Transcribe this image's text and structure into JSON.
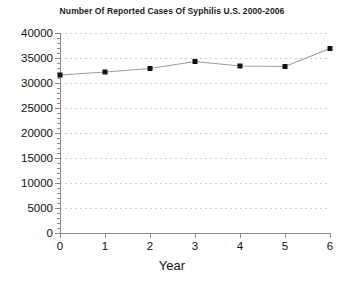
{
  "chart_data": {
    "type": "line",
    "title": "Number Of Reported Cases Of Syphilis U.S. 2000-2006",
    "xlabel": "Year",
    "ylabel": "",
    "x": [
      0,
      1,
      2,
      3,
      4,
      5,
      6
    ],
    "values": [
      31600,
      32200,
      32900,
      34300,
      33400,
      33300,
      36900
    ],
    "series": [
      {
        "name": "Reported Cases Of Syphilis",
        "values": [
          31600,
          32200,
          32900,
          34300,
          33400,
          33300,
          36900
        ]
      }
    ],
    "xlim": [
      0,
      6
    ],
    "ylim": [
      0,
      40000
    ],
    "x_ticks": [
      0,
      1,
      2,
      3,
      4,
      5,
      6
    ],
    "x_tick_labels": [
      "0",
      "1",
      "2",
      "3",
      "4",
      "5",
      "6"
    ],
    "y_ticks": [
      0,
      5000,
      10000,
      15000,
      20000,
      25000,
      30000,
      35000,
      40000
    ],
    "y_tick_labels": [
      "0",
      "5000",
      "10000",
      "15000",
      "20000",
      "25000",
      "30000",
      "35000",
      "40000"
    ],
    "y_minor_tick_count": 4,
    "grid": true,
    "grid_axis": "y",
    "grid_style": "dashed",
    "legend": false,
    "legend_position": "none",
    "marker": "square",
    "colors": {
      "line": "#9a9a9a",
      "marker": "#121212",
      "grid": "#d9c9c9",
      "axis": "#8a8a8a",
      "text": "#111111",
      "background": "#ffffff"
    }
  }
}
